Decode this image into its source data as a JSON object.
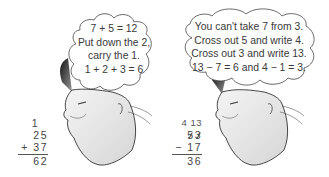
{
  "figure": {
    "left_panel": {
      "thought_bubble": {
        "lines": [
          "7 + 5 = 12",
          "Put down the 2,",
          "carry the 1.",
          "1 + 2 + 3 = 6"
        ]
      },
      "calculation": {
        "carry": "1",
        "top": "25",
        "operator_line": "+ 37",
        "result": "62"
      }
    },
    "right_panel": {
      "thought_bubble": {
        "lines": [
          "You can't take 7 from 3.",
          "Cross out 5 and write 4.",
          "Cross out 3 and write 13.",
          "13 − 7 = 6 and 4 − 1 = 3."
        ]
      },
      "calculation": {
        "borrow": "4 13",
        "top_digits": [
          "5",
          "3"
        ],
        "operator_line": "− 17",
        "result": "36"
      }
    }
  }
}
